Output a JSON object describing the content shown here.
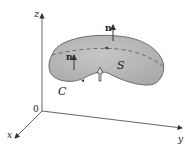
{
  "diagram": {
    "axes": {
      "z_label": "z",
      "x_label": "x",
      "y_label": "y",
      "origin_label": "0"
    },
    "surface_label": "S",
    "curve_label": "C",
    "normal_labels": [
      "n",
      "n"
    ],
    "colors": {
      "surface_fill": "#b5b5b5",
      "surface_edge": "#555555",
      "axis": "#444444",
      "boundary_dashed": "#555555"
    }
  }
}
